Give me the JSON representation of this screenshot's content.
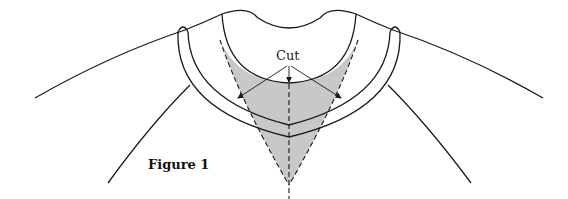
{
  "diagram": {
    "labels": {
      "cut": "Cut",
      "figure": "Figure 1"
    },
    "colors": {
      "line": "#1a1a1a",
      "cut_region_fill": "#c8c8c8",
      "background": "#ffffff"
    },
    "elements": [
      {
        "name": "shoulder-seam-left",
        "style": "solid"
      },
      {
        "name": "shoulder-seam-right",
        "style": "solid"
      },
      {
        "name": "raglan-line-left",
        "style": "solid"
      },
      {
        "name": "raglan-line-right",
        "style": "solid"
      },
      {
        "name": "collar-band",
        "style": "solid"
      },
      {
        "name": "neck-opening",
        "style": "solid"
      },
      {
        "name": "v-cut-region",
        "style": "dashed",
        "fill": "gray"
      },
      {
        "name": "center-fold-line",
        "style": "dashed"
      },
      {
        "name": "cut-arrows",
        "count": 3
      }
    ]
  }
}
